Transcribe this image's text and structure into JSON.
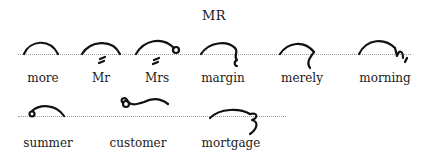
{
  "title": "MR",
  "rows": [
    {
      "words": [
        {
          "label": "more",
          "glyph": "arc"
        },
        {
          "label": "Mr",
          "glyph": "arc-with-dash"
        },
        {
          "label": "Mrs",
          "glyph": "arc-with-dash-and-circle"
        },
        {
          "label": "margin",
          "glyph": "arc-with-hook-down"
        },
        {
          "label": "merely",
          "glyph": "arc-with-squiggle-down"
        },
        {
          "label": "morning",
          "glyph": "arc-with-n-tail"
        }
      ]
    },
    {
      "words": [
        {
          "label": "summer",
          "glyph": "circle-arc"
        },
        {
          "label": "customer",
          "glyph": "raised-circle-stroke"
        },
        {
          "label": "mortgage",
          "glyph": "arc-with-three-hook"
        }
      ]
    }
  ]
}
